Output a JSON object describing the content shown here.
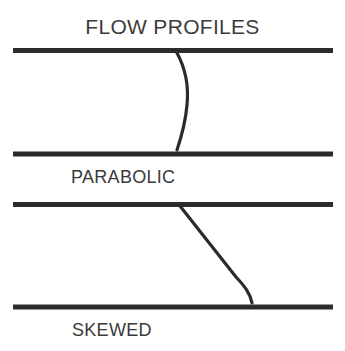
{
  "figure": {
    "title": "FLOW PROFILES",
    "background_color": "#ffffff",
    "ink_color": "#2b2b2b",
    "text_color": "#3c3c3c",
    "width": 345,
    "height": 351
  },
  "diagrams": [
    {
      "id": "parabolic",
      "label": "PARABOLIC",
      "description": "Pipe cross-section with a parabolic velocity flow profile curve",
      "pipe": {
        "top_wall_y": 50,
        "bottom_wall_y": 154,
        "x_start": 13,
        "x_end": 333,
        "wall_thickness": 5
      },
      "profile": {
        "type": "parabolic",
        "start": [
          176,
          52
        ],
        "apex": [
          187,
          103
        ],
        "end": [
          177,
          150
        ],
        "stroke_width": 3
      }
    },
    {
      "id": "skewed",
      "label": "SKEWED",
      "description": "Pipe cross-section with a skewed velocity flow profile curve",
      "pipe": {
        "top_wall_y": 204,
        "bottom_wall_y": 307,
        "x_start": 13,
        "x_end": 333,
        "wall_thickness": 5
      },
      "profile": {
        "type": "skewed",
        "start": [
          180,
          206
        ],
        "bend": [
          240,
          280
        ],
        "end": [
          252,
          303
        ],
        "stroke_width": 3
      }
    }
  ]
}
